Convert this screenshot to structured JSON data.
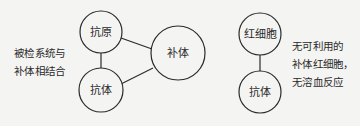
{
  "diagram": {
    "left_system": {
      "caption_lines": [
        "被检系统与",
        "补体相结合"
      ],
      "nodes": {
        "antigen": "抗原",
        "antibody": "抗体",
        "complement": "补体"
      }
    },
    "right_system": {
      "caption_lines": [
        "无可利用的",
        "补体红细胞，",
        "无溶血反应"
      ],
      "nodes": {
        "red_blood_cell": "红细胞",
        "antibody": "抗体"
      }
    },
    "colors": {
      "stroke": "#2a2a2a",
      "background": "#f4f4f2"
    }
  }
}
